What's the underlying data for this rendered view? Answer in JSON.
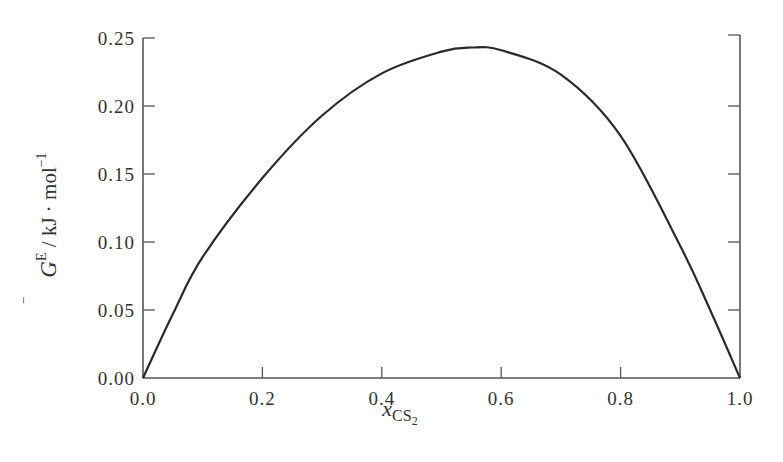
{
  "chart_data": {
    "type": "line",
    "title": "",
    "xlabel": "x_CS2",
    "ylabel": "G^E / kJ·mol^-1",
    "xlabel_parts": {
      "main": "x",
      "sub": "CS",
      "subsub": "2"
    },
    "ylabel_parts": {
      "main": "G",
      "bar": "‾",
      "sup": "E",
      "rest": " / kJ · mol",
      "rest_sup": "−1"
    },
    "xlim": [
      0.0,
      1.0
    ],
    "ylim": [
      0.0,
      0.25
    ],
    "x_ticks": [
      0.0,
      0.2,
      0.4,
      0.6,
      0.8,
      1.0
    ],
    "x_tick_labels": [
      "0.0",
      "0.2",
      "0.4",
      "0.6",
      "0.8",
      "1.0"
    ],
    "y_ticks": [
      0.0,
      0.05,
      0.1,
      0.15,
      0.2,
      0.25
    ],
    "y_tick_labels": [
      "0.00",
      "0.05",
      "0.10",
      "0.15",
      "0.20",
      "0.25"
    ],
    "grid": false,
    "legend": null,
    "series": [
      {
        "name": "G^E vs x_CS2",
        "color": "#2a2a2a",
        "x": [
          0.0,
          0.05,
          0.1,
          0.2,
          0.3,
          0.4,
          0.5,
          0.55,
          0.6,
          0.7,
          0.8,
          0.9,
          0.95,
          1.0
        ],
        "y": [
          0.0,
          0.047,
          0.089,
          0.147,
          0.193,
          0.224,
          0.24,
          0.243,
          0.241,
          0.223,
          0.178,
          0.097,
          0.05,
          0.0
        ]
      }
    ]
  }
}
